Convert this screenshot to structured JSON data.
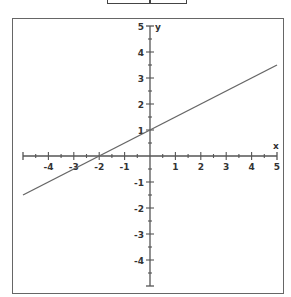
{
  "chart_data": {
    "type": "line",
    "title": "",
    "xlabel": "x",
    "ylabel": "y",
    "xlim": [
      -5,
      5
    ],
    "ylim": [
      -5,
      5
    ],
    "grid": false,
    "x_ticks": [
      -4,
      -3,
      -2,
      -1,
      1,
      2,
      3,
      4,
      5
    ],
    "y_ticks": [
      5,
      4,
      3,
      2,
      1,
      -1,
      -2,
      -3,
      -4
    ],
    "minor_tick_step": 0.5,
    "series": [
      {
        "name": "y = 0.5x + 1",
        "slope": 0.5,
        "intercept": 1,
        "x": [
          -5,
          5
        ],
        "y": [
          -1.5,
          3.5
        ]
      }
    ]
  },
  "colors": {
    "axis": "#555555",
    "line": "#666666",
    "frame": "#666666",
    "text": "#333333"
  }
}
